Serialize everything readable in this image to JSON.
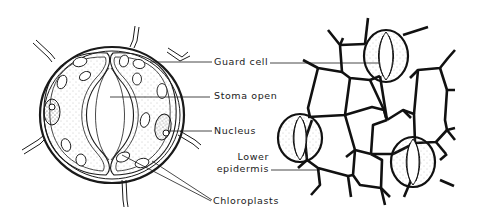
{
  "diagram": {
    "left_panel": "Enlarged stoma with two guard cells",
    "right_panel": "Lower epidermis surface view with three stomata"
  },
  "labels": {
    "guard_cell": "Guard cell",
    "stoma_open": "Stoma open",
    "nucleus": "Nucleus",
    "lower_epidermis_line1": "Lower",
    "lower_epidermis_line2": "epidermis",
    "chloroplasts": "Chloroplasts"
  },
  "colors": {
    "ink": "#1a1a1a",
    "background": "#ffffff",
    "stipple": "#9a9a9a"
  }
}
